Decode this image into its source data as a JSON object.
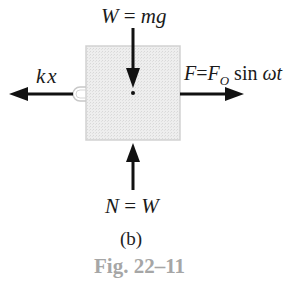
{
  "diagram": {
    "type": "free-body-diagram",
    "block": {
      "fill": "#ebebeb",
      "border": "#d4d4d4"
    },
    "forces": {
      "weight": {
        "label_left": "W",
        "label_eq": " = ",
        "label_right": "mg",
        "direction": "down"
      },
      "normal": {
        "label_left": "N",
        "label_eq": " = ",
        "label_right": "W",
        "direction": "up"
      },
      "spring": {
        "label": "kx",
        "direction": "left"
      },
      "applied": {
        "label_f": "F",
        "label_eq": "=",
        "label_f0": "F",
        "label_sub": "O",
        "label_sin": " sin ",
        "label_wt": "ωt",
        "direction": "right"
      }
    },
    "subcaption": "(b)",
    "figure_caption": "Fig. 22–11",
    "colors": {
      "arrow": "#111111",
      "caption": "#a6a6a6"
    }
  }
}
